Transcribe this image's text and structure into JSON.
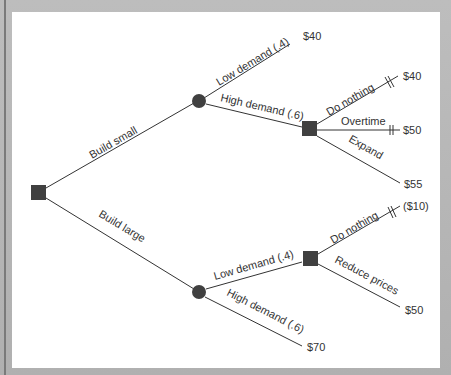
{
  "diagram": {
    "type": "decision-tree",
    "colors": {
      "node": "#404040",
      "line": "#333333",
      "panel": "#ffffff",
      "frame": "#b4b4b4"
    },
    "root": {
      "type": "decision",
      "shape": "square"
    },
    "branches": {
      "build_small": "Build small",
      "build_large": "Build large",
      "small_low": "Low demand (.4)",
      "small_high": "High demand (.6)",
      "small_high_do_nothing": "Do nothing",
      "small_high_overtime": "Overtime",
      "small_high_expand": "Expand",
      "large_low": "Low demand (.4)",
      "large_high": "High demand (.6)",
      "large_low_do_nothing": "Do nothing",
      "large_low_reduce": "Reduce prices"
    },
    "payoffs": {
      "small_low": "$40",
      "small_high_do_nothing": "$40",
      "small_high_overtime": "$50",
      "small_high_expand": "$55",
      "large_low_do_nothing": "($10)",
      "large_low_reduce": "$50",
      "large_high": "$70"
    },
    "pruned": [
      "small_high_do_nothing",
      "small_high_overtime",
      "large_low_do_nothing"
    ]
  }
}
